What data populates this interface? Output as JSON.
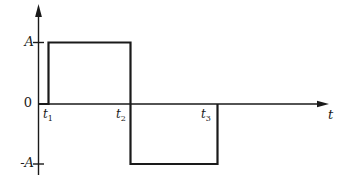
{
  "figure": {
    "background": "#ffffff",
    "line_color": "#1a1a1a"
  },
  "chart_data": {
    "type": "line",
    "subtype": "square-wave",
    "title": "",
    "xlabel": "t",
    "ylabel": "",
    "grid": false,
    "legend": false,
    "y_tick_labels": [
      "A",
      "0",
      "-A"
    ],
    "x_tick_labels": [
      "t1",
      "t2",
      "t3"
    ],
    "series": [
      {
        "piecewise": [
          {
            "interval": "0 to t1",
            "value": "0"
          },
          {
            "interval": "t1 to t2",
            "value": "A"
          },
          {
            "interval": "t2 to t3",
            "value": "-A"
          },
          {
            "interval": "after t3",
            "value": "0"
          }
        ]
      }
    ]
  },
  "labels": {
    "amplitude_pos": "A",
    "origin": "0",
    "amplitude_neg": "-A",
    "t1": {
      "base": "t",
      "sub": "1"
    },
    "t2": {
      "base": "t",
      "sub": "2"
    },
    "t3": {
      "base": "t",
      "sub": "3"
    },
    "time_axis": "t"
  }
}
